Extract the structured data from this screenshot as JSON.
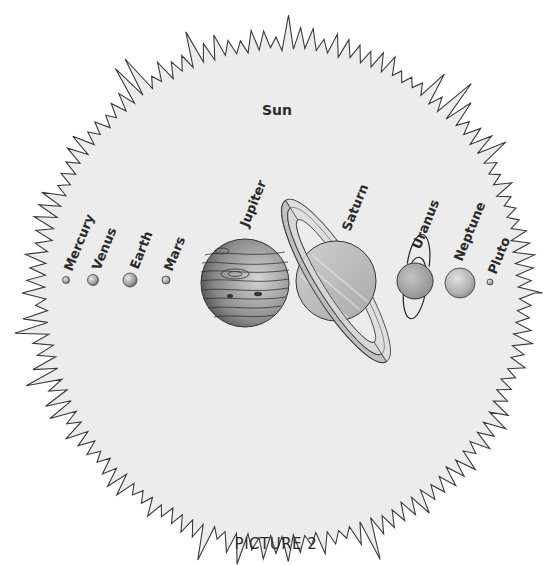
{
  "title": "Sun",
  "caption": "PICTURE 2",
  "colors": {
    "background": "#ffffff",
    "sun_fill": "#ececec",
    "sun_outline": "#3a3a3a",
    "ink": "#2a2a2a",
    "planet_light": "#d6d6d6",
    "planet_mid": "#a9a9a9",
    "planet_dark": "#6e6e6e"
  },
  "planets": [
    {
      "name": "Mercury",
      "label": "Mercury"
    },
    {
      "name": "Venus",
      "label": "Venus"
    },
    {
      "name": "Earth",
      "label": "Earth"
    },
    {
      "name": "Mars",
      "label": "Mars"
    },
    {
      "name": "Jupiter",
      "label": "Jupiter"
    },
    {
      "name": "Saturn",
      "label": "Saturn"
    },
    {
      "name": "Uranus",
      "label": "Uranus"
    },
    {
      "name": "Neptune",
      "label": "Neptune"
    },
    {
      "name": "Pluto",
      "label": "Pluto"
    }
  ]
}
